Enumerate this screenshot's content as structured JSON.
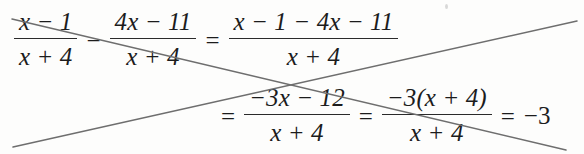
{
  "document": {
    "kind": "handwritten-crossed-out-algebra-work",
    "background_color": "#fdfdfc",
    "ink_color": "#1c1c1c",
    "strike_color": "#6e6e6e"
  },
  "math": {
    "line1": {
      "frac1": {
        "numerator": "x − 1",
        "denominator": "x + 4"
      },
      "operator": "−",
      "frac2": {
        "numerator": "4x − 11",
        "denominator": "x + 4"
      },
      "equals": "=",
      "frac3": {
        "numerator": "x − 1 − 4x − 11",
        "denominator": "x + 4"
      }
    },
    "line2": {
      "equals1": "=",
      "frac1": {
        "numerator": "−3x − 12",
        "denominator": "x + 4"
      },
      "equals2": "=",
      "frac2": {
        "numerator": "−3(x + 4)",
        "denominator": "x + 4"
      },
      "equals3": "=",
      "result": "−3"
    }
  },
  "annotations": {
    "strike_descending": {
      "x1": 12,
      "y1": 19,
      "x2": 566,
      "y2": 150
    },
    "strike_ascending": {
      "x1": 13,
      "y1": 147,
      "x2": 577,
      "y2": 21
    },
    "intersection": {
      "x": 292,
      "y": 84
    }
  }
}
